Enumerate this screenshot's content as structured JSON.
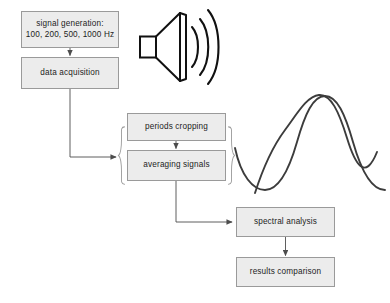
{
  "diagram": {
    "background_color": "#ffffff",
    "box_fill_color": "#ececec",
    "box_border_color": "#9a9a9a",
    "line_color": "#4d4d4d",
    "wave_color": "#3c3c3c",
    "boxes": {
      "signal_generation": {
        "line1": "signal generation:",
        "line2": "100, 200, 500, 1000 Hz"
      },
      "data_acquisition": {
        "label": "data acquisition"
      },
      "periods_cropping": {
        "label": "periods cropping"
      },
      "averaging_signals": {
        "label": "averaging signals"
      },
      "spectral_analysis": {
        "label": "spectral analysis"
      },
      "results_comparison": {
        "label": "results comparison"
      }
    },
    "icons": {
      "speaker": "loudspeaker-icon",
      "sound_waves": "sound-arc-icon",
      "waveform": "sine-waveform-icon",
      "grouping_left": "left-curly-brace",
      "grouping_right": "right-curly-brace"
    },
    "connectors": [
      {
        "name": "signal-generation-to-data-acquisition",
        "from": "signal_generation",
        "to": "data_acquisition",
        "arrow": true
      },
      {
        "name": "data-acquisition-to-processing-group",
        "from": "data_acquisition",
        "to": "processing_group",
        "arrow": true
      },
      {
        "name": "periods-cropping-to-averaging-signals",
        "from": "periods_cropping",
        "to": "averaging_signals",
        "arrow": true
      },
      {
        "name": "averaging-signals-to-spectral-analysis",
        "from": "averaging_signals",
        "to": "spectral_analysis",
        "arrow": true
      },
      {
        "name": "spectral-analysis-to-results-comparison",
        "from": "spectral_analysis",
        "to": "results_comparison",
        "arrow": true
      }
    ]
  }
}
